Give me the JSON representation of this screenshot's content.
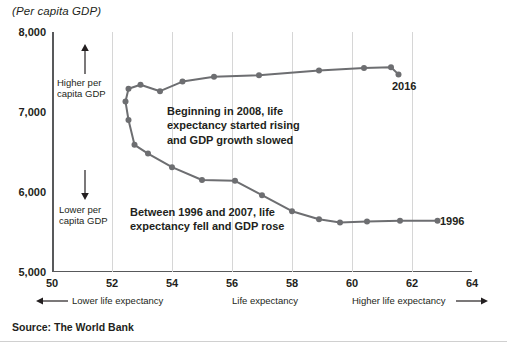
{
  "title": "(Per capita GDP)",
  "source": "Source: The World Bank",
  "axis_labels": {
    "x_left": "Lower life expectancy",
    "x_center": "Life expectancy",
    "x_right": "Higher life expectancy",
    "y_high_line1": "Higher per",
    "y_high_line2": "capita GDP",
    "y_low_line1": "Lower per",
    "y_low_line2": "capita GDP"
  },
  "annotations": {
    "upper": "Beginning in 2008, life expectancy started rising and GDP growth slowed",
    "lower": "Between 1996 and 2007, life expectancy fell and GDP rose",
    "label_2016": "2016",
    "label_1996": "1996"
  },
  "colors": {
    "line": "#6d6e71",
    "axis": "#58595b",
    "grid": "#d6d6d6",
    "text": "#231f20"
  },
  "chart_data": {
    "type": "line",
    "title": "(Per capita GDP)",
    "xlabel": "Life expectancy",
    "ylabel": "Per capita GDP",
    "xlim": [
      50,
      64
    ],
    "ylim": [
      5000,
      8000
    ],
    "xticks": [
      "50",
      "52",
      "54",
      "56",
      "58",
      "60",
      "62",
      "64"
    ],
    "yticks": [
      "5,000",
      "6,000",
      "7,000",
      "8,000"
    ],
    "grid": "vertical",
    "legend": "none",
    "series": [
      {
        "name": "Life expectancy vs per capita GDP, 1996-2016",
        "points": [
          {
            "year": 1996,
            "x": 62.85,
            "y": 5640
          },
          {
            "year": 1997,
            "x": 61.6,
            "y": 5640
          },
          {
            "year": 1998,
            "x": 60.5,
            "y": 5630
          },
          {
            "year": 1999,
            "x": 59.6,
            "y": 5620
          },
          {
            "year": 2000,
            "x": 58.9,
            "y": 5660
          },
          {
            "year": 2001,
            "x": 58.0,
            "y": 5760
          },
          {
            "year": 2002,
            "x": 57.0,
            "y": 5960
          },
          {
            "year": 2003,
            "x": 56.1,
            "y": 6140
          },
          {
            "year": 2004,
            "x": 55.0,
            "y": 6150
          },
          {
            "year": 2005,
            "x": 54.0,
            "y": 6310
          },
          {
            "year": 2006,
            "x": 53.2,
            "y": 6480
          },
          {
            "year": 2007,
            "x": 52.75,
            "y": 6590
          },
          {
            "year": 2008,
            "x": 52.55,
            "y": 6900
          },
          {
            "year": 2009,
            "x": 52.45,
            "y": 7130
          },
          {
            "year": 2010,
            "x": 52.55,
            "y": 7290
          },
          {
            "year": 2011,
            "x": 52.95,
            "y": 7340
          },
          {
            "year": 2012,
            "x": 53.6,
            "y": 7260
          },
          {
            "year": 2013,
            "x": 54.35,
            "y": 7380
          },
          {
            "year": 2014,
            "x": 55.4,
            "y": 7440
          },
          {
            "year": 2015,
            "x": 56.9,
            "y": 7460
          },
          {
            "year": 2016,
            "x": 58.9,
            "y": 7520
          },
          {
            "year": 2017,
            "x": 60.4,
            "y": 7550
          },
          {
            "year": 2018,
            "x": 61.3,
            "y": 7560
          },
          {
            "year": 2019,
            "x": 61.55,
            "y": 7470
          }
        ]
      }
    ]
  }
}
